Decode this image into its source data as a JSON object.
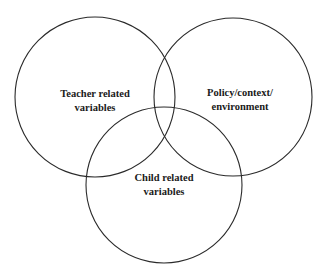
{
  "diagram": {
    "type": "venn",
    "sets": [
      {
        "id": "teacher",
        "lines": [
          "Teacher related",
          "variables"
        ],
        "circle": {
          "cx": 95,
          "cy": 97,
          "r": 80
        },
        "label_pos": {
          "x": 95,
          "y1": 97,
          "y2": 111
        }
      },
      {
        "id": "policy",
        "lines": [
          "Policy/context/",
          "environment"
        ],
        "circle": {
          "cx": 233,
          "cy": 97,
          "r": 79
        },
        "label_pos": {
          "x": 240,
          "y1": 96,
          "y2": 110
        }
      },
      {
        "id": "child",
        "lines": [
          "Child related",
          "variables"
        ],
        "circle": {
          "cx": 164,
          "cy": 185,
          "r": 78
        },
        "label_pos": {
          "x": 164,
          "y1": 181,
          "y2": 195
        }
      }
    ],
    "stroke_color": "#2a2a2a",
    "background": "#ffffff"
  }
}
